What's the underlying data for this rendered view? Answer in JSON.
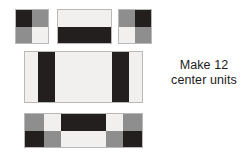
{
  "canvas": {
    "width": 249,
    "height": 152,
    "background": "#ffffff"
  },
  "palette": {
    "dark": "#231f1f",
    "medium": "#8e8e8e",
    "light": "#f1f0ee",
    "outline": "#b9b9b9",
    "text": "#1b1b1b"
  },
  "caption": {
    "line1": "Make 12",
    "line2": "center units",
    "quantity": "12"
  },
  "diagram": {
    "units": [
      {
        "id": "unit-a",
        "name": "four-patch-unit-left",
        "rows": 2,
        "cols": 2,
        "cells": [
          {
            "tone": "dark",
            "position": "top-left"
          },
          {
            "tone": "medium",
            "position": "top-right"
          },
          {
            "tone": "medium",
            "position": "bottom-left"
          },
          {
            "tone": "light",
            "position": "bottom-right"
          }
        ]
      },
      {
        "id": "unit-b",
        "name": "two-bar-unit-center-top",
        "rows": 2,
        "cols": 1,
        "cells": [
          {
            "tone": "light",
            "position": "top"
          },
          {
            "tone": "dark",
            "position": "bottom"
          }
        ]
      },
      {
        "id": "unit-c",
        "name": "four-patch-unit-right",
        "rows": 2,
        "cols": 2,
        "cells": [
          {
            "tone": "medium",
            "position": "top-left"
          },
          {
            "tone": "dark",
            "position": "top-right"
          },
          {
            "tone": "light",
            "position": "bottom-left"
          },
          {
            "tone": "medium",
            "position": "bottom-right"
          }
        ]
      },
      {
        "id": "unit-d",
        "name": "striped-band-unit",
        "rows": 1,
        "cols": 5,
        "cells": [
          {
            "tone": "light",
            "position": "col-1"
          },
          {
            "tone": "dark",
            "position": "col-2"
          },
          {
            "tone": "light",
            "position": "col-3"
          },
          {
            "tone": "dark",
            "position": "col-4"
          },
          {
            "tone": "light",
            "position": "col-5"
          }
        ]
      },
      {
        "id": "unit-e",
        "name": "checker-band-unit",
        "rows": 2,
        "cols": 5,
        "cells": [
          {
            "tone": "medium",
            "position": "r1c1"
          },
          {
            "tone": "light",
            "position": "r1c2"
          },
          {
            "tone": "dark",
            "position": "r1c3"
          },
          {
            "tone": "light",
            "position": "r1c4"
          },
          {
            "tone": "medium",
            "position": "r1c5"
          },
          {
            "tone": "dark",
            "position": "r2c1"
          },
          {
            "tone": "medium",
            "position": "r2c2"
          },
          {
            "tone": "light",
            "position": "r2c3"
          },
          {
            "tone": "medium",
            "position": "r2c4"
          },
          {
            "tone": "dark",
            "position": "r2c5"
          }
        ]
      }
    ]
  }
}
